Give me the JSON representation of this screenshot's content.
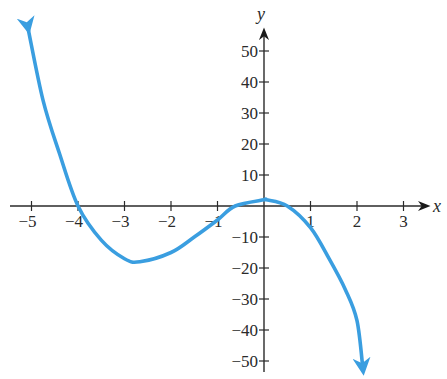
{
  "chart_data": {
    "type": "line",
    "title": "",
    "xlabel": "x",
    "ylabel": "y",
    "xlim": [
      -5,
      3
    ],
    "ylim": [
      -50,
      50
    ],
    "grid": false,
    "legend": null,
    "x_ticks": [
      -5,
      -4,
      -3,
      -2,
      -1,
      1,
      2,
      3
    ],
    "x_tick_labels": [
      "−5",
      "−4",
      "−3",
      "−2",
      "−1",
      "1",
      "2",
      "3"
    ],
    "y_ticks": [
      50,
      40,
      30,
      20,
      10,
      -10,
      -20,
      -30,
      -40,
      -50
    ],
    "y_tick_labels": [
      "50",
      "40",
      "30",
      "20",
      "10",
      "−10",
      "−20",
      "−30",
      "−40",
      "−50"
    ],
    "series": [
      {
        "name": "f(x)",
        "color": "#3a9ee0",
        "arrows_both_ends": true,
        "x": [
          -5.07,
          -4.75,
          -4.4,
          -4,
          -3.5,
          -3,
          -2.67,
          -2,
          -1.5,
          -1,
          -0.62,
          0,
          0.05,
          0.5,
          1,
          1.4,
          1.75,
          2,
          2.13
        ],
        "y": [
          57,
          34,
          17,
          0,
          -11,
          -17,
          -18,
          -15,
          -10,
          -4.5,
          0,
          2,
          2,
          0,
          -7,
          -17,
          -27,
          -37,
          -53
        ]
      }
    ],
    "features": {
      "x_intercepts": [
        -4,
        -0.62,
        0.5
      ],
      "local_min": [
        -2.67,
        -18
      ],
      "local_max": [
        0.05,
        2
      ]
    }
  },
  "axes": {
    "x_label": "x",
    "y_label": "y"
  }
}
